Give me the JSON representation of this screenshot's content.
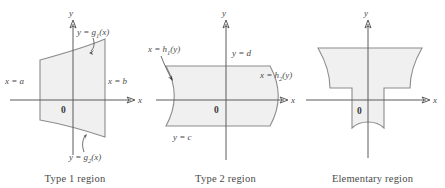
{
  "figure": {
    "background_color": "#ffffff",
    "region_fill_color": "#f1f0f0",
    "region_stroke_color": "#8c8c8c",
    "axis_color": "#5a5a5a",
    "text_color": "#4a4a4a"
  },
  "panels": [
    {
      "id": "type-1",
      "caption": "Type 1 region",
      "origin_label": "0",
      "axis_x_label": "x",
      "axis_y_label": "y",
      "description": "Region bounded left and right by vertical lines x = a and x = b, above by y = g1(x) and below by y = g2(x)",
      "labels": {
        "left_boundary": "x = a",
        "right_boundary": "x = b",
        "top_curve_prefix": "y = g",
        "top_curve_sub": "1",
        "top_curve_suffix": "(x)",
        "bottom_curve_prefix": "y = g",
        "bottom_curve_sub": "2",
        "bottom_curve_suffix": "(x)"
      }
    },
    {
      "id": "type-2",
      "caption": "Type 2 region",
      "origin_label": "0",
      "axis_x_label": "x",
      "axis_y_label": "y",
      "description": "Region bounded above and below by horizontal lines y = d and y = c, left by x = h1(y) and right by x = h2(y)",
      "labels": {
        "top_boundary": "y = d",
        "bottom_boundary": "y = c",
        "left_curve_prefix": "x = h",
        "left_curve_sub": "1",
        "left_curve_suffix": "(y)",
        "right_curve_prefix": "x = h",
        "right_curve_sub": "2",
        "right_curve_suffix": "(y)"
      }
    },
    {
      "id": "elementary",
      "caption": "Elementary region",
      "origin_label": "0",
      "axis_x_label": "x",
      "axis_y_label": "y",
      "description": "T-shaped region, a union of a wide upper block with curved sides and a narrow lower block with a curved bottom"
    }
  ]
}
